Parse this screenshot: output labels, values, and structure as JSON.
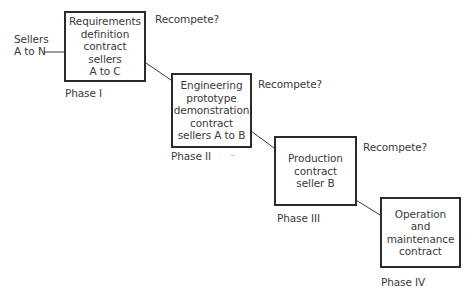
{
  "diagram": {
    "type": "staircase phase flow",
    "sellers_label": "Sellers\nA to N",
    "phases": [
      {
        "id": "phase-1",
        "phase_label": "Phase I",
        "box_text": "Requirements\ndefinition\ncontract\nsellers\nA to C",
        "recompete_label": "Recompete?"
      },
      {
        "id": "phase-2",
        "phase_label": "Phase II",
        "box_text": "Engineering\nprototype\ndemonstration\ncontract\nsellers A to B",
        "recompete_label": "Recompete?"
      },
      {
        "id": "phase-3",
        "phase_label": "Phase III",
        "box_text": "Production\ncontract\nseller B",
        "recompete_label": "Recompete?"
      },
      {
        "id": "phase-4",
        "phase_label": "Phase IV",
        "box_text": "Operation\nand\nmaintenance\ncontract"
      }
    ],
    "colors": {
      "box_border": "#2b2b2b",
      "line": "#3a3a3a",
      "text": "#3a3a3a",
      "background": "#ffffff"
    }
  }
}
